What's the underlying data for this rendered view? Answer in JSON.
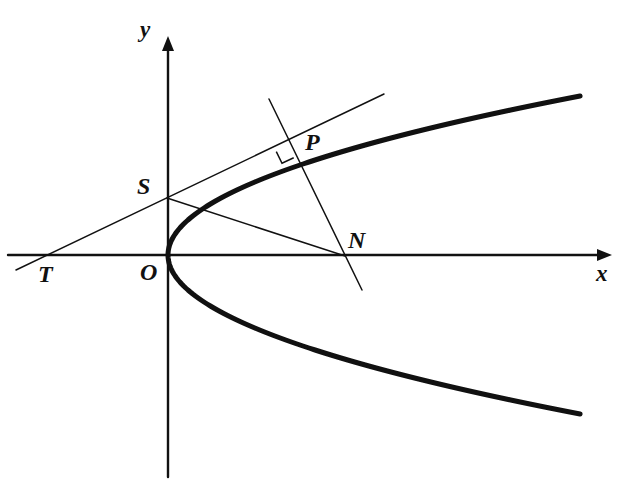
{
  "figure": {
    "kind": "geometry-diagram",
    "background_color": "#ffffff",
    "ink_color": "#111111",
    "width": 626,
    "height": 492
  },
  "axes": {
    "x": {
      "label": "x",
      "label_x": 596,
      "label_y": 262,
      "y_pos": 255,
      "x_start": 8,
      "x_end": 612,
      "arrow": "right",
      "stroke_width": 2.4
    },
    "y": {
      "label": "y",
      "label_x": 140,
      "label_y": 18,
      "x_pos": 168,
      "y_start": 477,
      "y_end": 36,
      "arrow": "up",
      "stroke_width": 2.4
    },
    "origin": {
      "x": 168,
      "y": 255
    }
  },
  "curve": {
    "name": "parabola",
    "orientation": "opens-right",
    "vertex": {
      "x": 168,
      "y": 255
    },
    "semi_latus_param": 0.0163,
    "stroke_width": 5,
    "y_top_end": 48,
    "y_bottom_end": 464,
    "x_right_end": 590,
    "sample_points": [
      {
        "x": 168,
        "y": 255
      },
      {
        "x": 173,
        "y": 237
      },
      {
        "x": 184,
        "y": 224
      },
      {
        "x": 203,
        "y": 214
      },
      {
        "x": 225,
        "y": 205
      },
      {
        "x": 260,
        "y": 185
      },
      {
        "x": 288,
        "y": 146
      },
      {
        "x": 330,
        "y": 122
      },
      {
        "x": 400,
        "y": 95
      },
      {
        "x": 480,
        "y": 70
      },
      {
        "x": 590,
        "y": 48
      }
    ]
  },
  "points": [
    {
      "id": "T",
      "label": "T",
      "x": 50,
      "y": 256,
      "label_x": 38,
      "label_y": 262,
      "on": "x-axis"
    },
    {
      "id": "O",
      "label": "O",
      "x": 168,
      "y": 255,
      "label_x": 140,
      "label_y": 260,
      "on": "origin"
    },
    {
      "id": "S",
      "label": "S",
      "x": 167,
      "y": 198,
      "label_x": 137,
      "label_y": 174,
      "on": "y-axis"
    },
    {
      "id": "P",
      "label": "P",
      "x": 288,
      "y": 146,
      "label_x": 305,
      "label_y": 130,
      "on": "parabola"
    },
    {
      "id": "N",
      "label": "N",
      "x": 345,
      "y": 256,
      "label_x": 348,
      "label_y": 228,
      "on": "x-axis"
    }
  ],
  "lines": [
    {
      "id": "tangent",
      "name": "tangent-line-TP",
      "from": {
        "x": 16,
        "y": 270
      },
      "to": {
        "x": 384,
        "y": 94
      },
      "stroke_width": 1.5
    },
    {
      "id": "normal",
      "name": "normal-line-PN",
      "from": {
        "x": 269,
        "y": 99
      },
      "to": {
        "x": 362,
        "y": 290
      },
      "stroke_width": 1.5
    },
    {
      "id": "chord",
      "name": "segment-SN",
      "from": {
        "x": 167,
        "y": 198
      },
      "to": {
        "x": 345,
        "y": 256
      },
      "stroke_width": 1.5
    }
  ],
  "right_angle_marker": {
    "name": "right-angle-at-P",
    "at": {
      "x": 288,
      "y": 146
    },
    "size": 13,
    "stroke_width": 1.5
  }
}
